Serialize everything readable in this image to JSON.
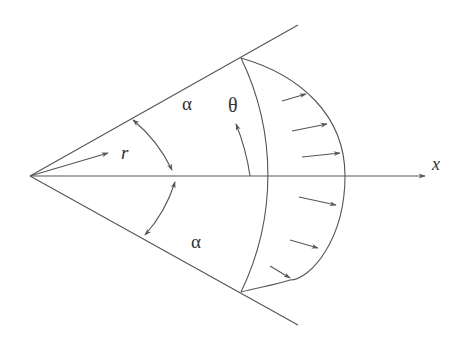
{
  "diagram": {
    "labels": {
      "alpha_upper": "α",
      "alpha_lower": "α",
      "theta": "θ",
      "r": "r",
      "x": "x"
    },
    "colors": {
      "line": "#555555",
      "text": "#333333",
      "background": "#ffffff"
    },
    "elements": [
      "wedge-upper-wall",
      "wedge-lower-wall",
      "x-axis-arrow",
      "radius-r-arrow",
      "alpha-double-arrow-arc",
      "theta-arc-arrow",
      "reference-arc",
      "velocity-profile-curve",
      "velocity-vectors"
    ],
    "velocity_vector_count": 6
  }
}
